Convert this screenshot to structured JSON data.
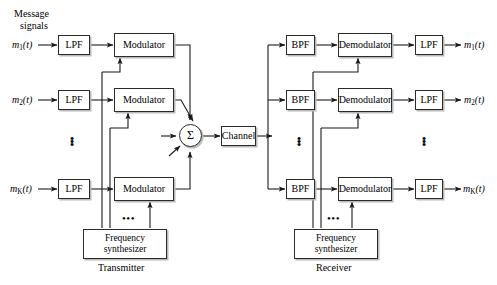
{
  "diagram": {
    "colors": {
      "background": "#ffffff",
      "stroke": "#2b2b2b",
      "shadow": "#b9b9b9",
      "text": "#000000"
    },
    "labels": {
      "message_signals_line1": "Message",
      "message_signals_line2": "signals",
      "transmitter": "Transmitter",
      "receiver": "Receiver",
      "ellipsis_h": "•••",
      "dot": "•"
    },
    "transmitter": {
      "caption": "Transmitter",
      "inputs": [
        {
          "name": "m1",
          "base": "m",
          "sub": "1",
          "arg": "(t)"
        },
        {
          "name": "m2",
          "base": "m",
          "sub": "2",
          "arg": "(t)"
        },
        {
          "name": "mK",
          "base": "m",
          "sub": "K",
          "arg": "(t)"
        }
      ],
      "filters": [
        {
          "label": "LPF"
        },
        {
          "label": "LPF"
        },
        {
          "label": "LPF"
        }
      ],
      "modulators": [
        {
          "label": "Modulator"
        },
        {
          "label": "Modulator"
        },
        {
          "label": "Modulator"
        }
      ],
      "synthesizer": {
        "line1": "Frequency",
        "line2": "synthesizer"
      },
      "summer": {
        "symbol": "Σ"
      }
    },
    "channel": {
      "label": "Channel"
    },
    "receiver": {
      "caption": "Receiver",
      "bandpass": [
        {
          "label": "BPF"
        },
        {
          "label": "BPF"
        },
        {
          "label": "BPF"
        }
      ],
      "demodulators": [
        {
          "label": "Demodulator"
        },
        {
          "label": "Demodulator"
        },
        {
          "label": "Demodulator"
        }
      ],
      "filters": [
        {
          "label": "LPF"
        },
        {
          "label": "LPF"
        },
        {
          "label": "LPF"
        }
      ],
      "outputs": [
        {
          "name": "m1",
          "base": "m",
          "sub": "1",
          "arg": "(t)"
        },
        {
          "name": "m2",
          "base": "m",
          "sub": "2",
          "arg": "(t)"
        },
        {
          "name": "mK",
          "base": "m",
          "sub": "K",
          "arg": "(t)"
        }
      ],
      "synthesizer": {
        "line1": "Frequency",
        "line2": "synthesizer"
      }
    }
  }
}
